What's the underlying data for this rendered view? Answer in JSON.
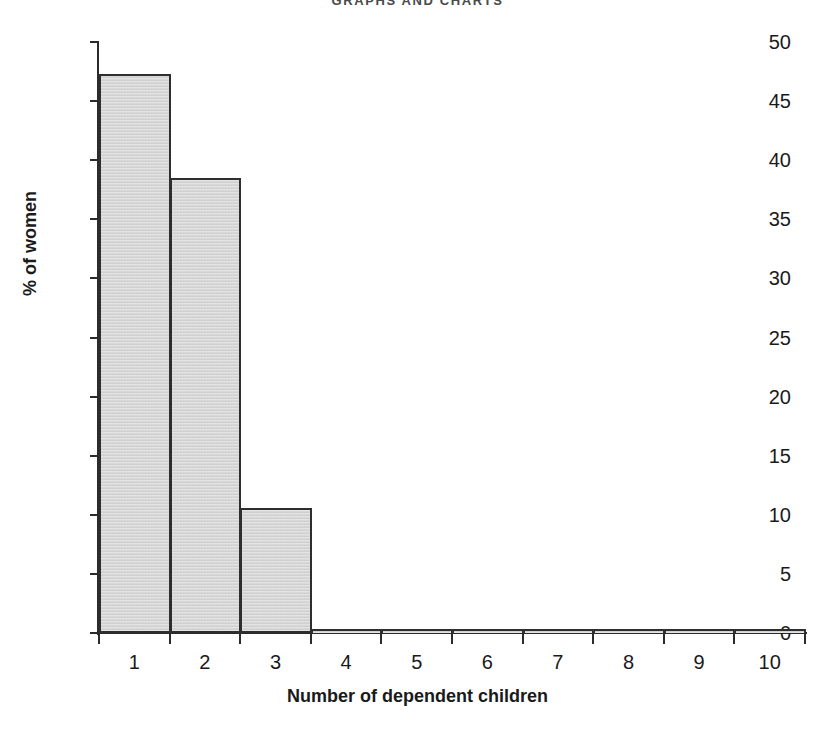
{
  "page": {
    "running_header": "GRAPHS AND CHARTS",
    "background_color": "#ffffff"
  },
  "chart_data": {
    "type": "bar",
    "title": "",
    "subtitle": "",
    "xlabel": "Number of dependent children",
    "ylabel": "% of women",
    "categories": [
      "1",
      "2",
      "3",
      "4",
      "5",
      "6",
      "7",
      "8",
      "9",
      "10"
    ],
    "values": [
      47.3,
      38.5,
      10.6,
      0.3,
      0.3,
      0.3,
      0.3,
      0.3,
      0.3,
      0.3
    ],
    "ylim": [
      0,
      50
    ],
    "xlim": [
      0.5,
      10.5
    ],
    "y_ticks": [
      0,
      5,
      10,
      15,
      20,
      25,
      30,
      35,
      40,
      45,
      50
    ],
    "y_tick_labels": [
      "0",
      "5",
      "10",
      "15",
      "20",
      "25",
      "30",
      "35",
      "40",
      "45",
      "50"
    ],
    "x_tick_labels": [
      "1",
      "2",
      "3",
      "4",
      "5",
      "6",
      "7",
      "8",
      "9",
      "10"
    ],
    "grid": false,
    "legend": false,
    "legend_position": "none",
    "bar_fill_color": "#d7d7d7",
    "bar_edge_color": "#2e2e2e",
    "axis_color": "#2b2b2b",
    "text_color": "#1a1a1a",
    "annotations": []
  }
}
